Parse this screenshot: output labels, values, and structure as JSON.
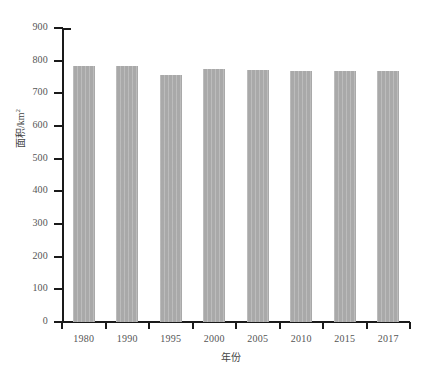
{
  "chart_data": {
    "type": "bar",
    "title": "",
    "subtitle": "",
    "xlabel": "年份",
    "ylabel": "面积/km2",
    "ylabel_base": "面积/km",
    "ylabel_exponent": "2",
    "categories": [
      "1980",
      "1990",
      "1995",
      "2000",
      "2005",
      "2010",
      "2015",
      "2017"
    ],
    "values": [
      785,
      783,
      755,
      775,
      773,
      768,
      767,
      768
    ],
    "ylim": [
      0,
      900
    ],
    "ytick_values": [
      0,
      100,
      200,
      300,
      400,
      500,
      600,
      700,
      800,
      900
    ],
    "ytick_labels": [
      "0",
      "100",
      "200",
      "300",
      "400",
      "500",
      "600",
      "700",
      "800",
      "900"
    ],
    "grid": false,
    "legend": null,
    "legend_position": "none",
    "bar_color": "#a9a9a9",
    "axis_color": "#1a1a1a",
    "tick_label_color": "#555555",
    "background_color": "#ffffff",
    "annotations": []
  }
}
